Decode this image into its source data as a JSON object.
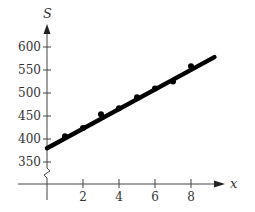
{
  "chart_data": {
    "type": "scatter",
    "title": "",
    "xlabel": "x",
    "ylabel": "S",
    "xlim": [
      0,
      9.5
    ],
    "ylim": [
      330,
      630
    ],
    "y_axis_break": true,
    "grid": false,
    "legend": null,
    "x_ticks": [
      2,
      4,
      6,
      8
    ],
    "x_tick_labels": [
      "2",
      "4",
      "6",
      "8"
    ],
    "y_ticks": [
      350,
      400,
      450,
      500,
      550,
      600
    ],
    "y_tick_labels": [
      "350",
      "400",
      "450",
      "500",
      "550",
      "600"
    ],
    "series": [
      {
        "name": "data points",
        "type": "scatter",
        "x": [
          1,
          2,
          3,
          4,
          5,
          6,
          7,
          8
        ],
        "y": [
          406,
          424,
          454,
          467,
          491,
          510,
          525,
          558
        ]
      },
      {
        "name": "fitted line",
        "type": "line",
        "x": [
          0,
          9.3
        ],
        "y": [
          380,
          578
        ]
      }
    ]
  }
}
